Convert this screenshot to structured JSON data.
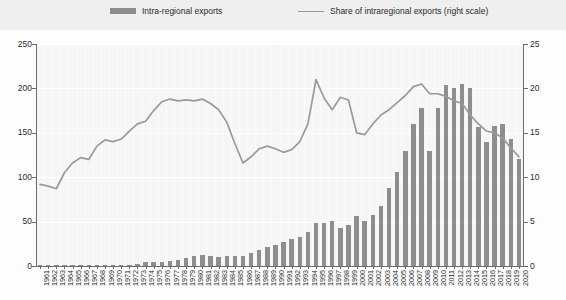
{
  "legend": {
    "bar_label": "Intra-regional exports",
    "line_label": "Share of intraregional exports (right scale)",
    "bar_swatch_icon": "bar-swatch-icon",
    "line_swatch_icon": "line-swatch-icon"
  },
  "colors": {
    "bar": "#8e8e8e",
    "line": "#9a9a9a",
    "plot_background": "#f6f6f6",
    "legend_background": "#efefef",
    "gridline": "#ffffff",
    "axis": "#6b6b6b",
    "text": "#2b2b2b"
  },
  "axes": {
    "left_ticks": [
      "0",
      "50",
      "100",
      "150",
      "200",
      "250"
    ],
    "right_ticks": [
      "0",
      "5",
      "10",
      "15",
      "20",
      "25"
    ],
    "left_min": 0,
    "left_max": 250,
    "right_min": 0,
    "right_max": 25,
    "grid": true
  },
  "chart_data": {
    "type": "bar",
    "title": "",
    "subtitle": "",
    "xlabel": "",
    "ylabel": "",
    "y2label": "",
    "ylim": [
      0,
      250
    ],
    "y2lim": [
      0,
      25
    ],
    "grid": true,
    "legend_position": "top",
    "categories": [
      "1961",
      "1962",
      "1963",
      "1964",
      "1965",
      "1966",
      "1967",
      "1968",
      "1969",
      "1970",
      "1971",
      "1972",
      "1973",
      "1974",
      "1975",
      "1976",
      "1977",
      "1978",
      "1979",
      "1980",
      "1981",
      "1982",
      "1983",
      "1984",
      "1985",
      "1986",
      "1987",
      "1988",
      "1989",
      "1990",
      "1991",
      "1992",
      "1993",
      "1994",
      "1995",
      "1996",
      "1997",
      "1998",
      "1999",
      "2000",
      "2001",
      "2002",
      "2003",
      "2004",
      "2005",
      "2006",
      "2007",
      "2008",
      "2009",
      "2010",
      "2011",
      "2012",
      "2013",
      "2014",
      "2015",
      "2016",
      "2017",
      "2018",
      "2019",
      "2020"
    ],
    "series": [
      {
        "name": "Intra-regional exports",
        "type": "bar",
        "axis": "left",
        "color": "#8e8e8e",
        "values": [
          0.3,
          0.3,
          0.4,
          0.4,
          0.5,
          0.5,
          0.6,
          0.7,
          0.8,
          1.0,
          1.2,
          1.6,
          2.6,
          4.5,
          4.3,
          5.0,
          5.6,
          6.4,
          8.6,
          11.5,
          12.0,
          10.8,
          10.3,
          11.2,
          11.0,
          11.5,
          14.5,
          18.5,
          21.0,
          24.0,
          26.5,
          30.0,
          33.0,
          38.5,
          48.0,
          48.5,
          51.0,
          43.0,
          46.0,
          56.0,
          51.0,
          57.0,
          68.0,
          88.0,
          106.0,
          129.0,
          160.0,
          178.0,
          130.0,
          178.0,
          204.0,
          200.0,
          205.0,
          201.0,
          157.0,
          140.0,
          158.0,
          160.0,
          143.0,
          120.0
        ]
      },
      {
        "name": "Share of intraregional exports (right scale)",
        "type": "line",
        "axis": "right",
        "color": "#9a9a9a",
        "values": [
          9.2,
          9.0,
          8.7,
          10.5,
          11.6,
          12.2,
          12.0,
          13.5,
          14.2,
          14.0,
          14.3,
          15.2,
          16.0,
          16.3,
          17.5,
          18.5,
          18.8,
          18.6,
          18.7,
          18.6,
          18.8,
          18.3,
          17.6,
          16.2,
          13.8,
          11.6,
          12.3,
          13.2,
          13.5,
          13.2,
          12.8,
          13.1,
          14.0,
          16.0,
          21.0,
          18.9,
          17.6,
          19.0,
          18.7,
          15.0,
          14.8,
          16.0,
          17.0,
          17.6,
          18.4,
          19.2,
          20.2,
          20.5,
          19.4,
          19.4,
          19.1,
          18.6,
          18.3,
          17.0,
          16.0,
          15.2,
          15.0,
          14.4,
          13.3,
          12.3
        ]
      }
    ]
  }
}
